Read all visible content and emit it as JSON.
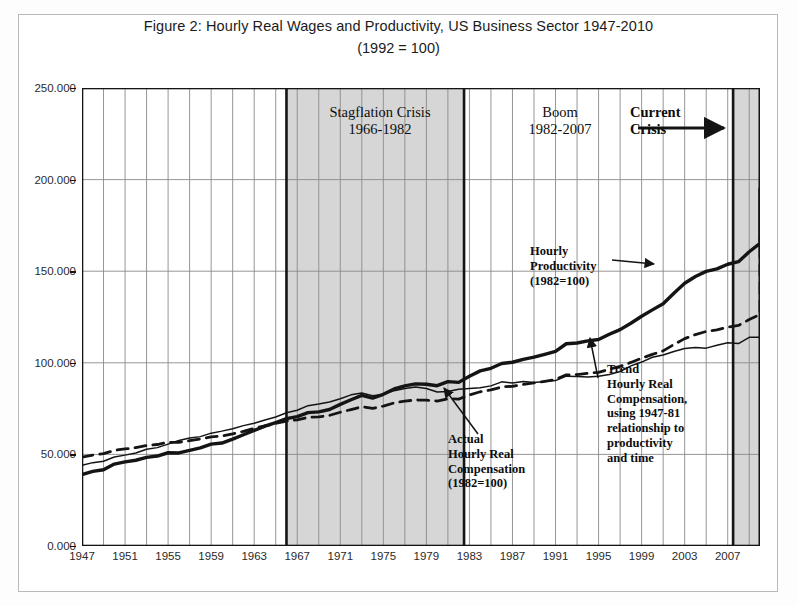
{
  "figure": {
    "title": "Figure 2: Hourly Real Wages and Productivity, US Business Sector 1947-2010",
    "subtitle": "(1992 = 100)"
  },
  "axes": {
    "y_ticks": [
      "0.000",
      "50.000",
      "100.000",
      "150.000",
      "200.000",
      "250.000"
    ],
    "y_values": [
      0,
      50,
      100,
      150,
      200,
      250
    ],
    "x_ticks": [
      "1947",
      "1951",
      "1955",
      "1959",
      "1963",
      "1967",
      "1971",
      "1975",
      "1979",
      "1983",
      "1987",
      "1991",
      "1995",
      "1999",
      "2003",
      "2007"
    ],
    "x_values": [
      1947,
      1951,
      1955,
      1959,
      1963,
      1967,
      1971,
      1975,
      1979,
      1983,
      1987,
      1991,
      1995,
      1999,
      2003,
      2007
    ]
  },
  "annotations": {
    "stagflation": "Stagflation Crisis\n1966-1982",
    "boom": "Boom\n1982-2007",
    "current_crisis": "Current\nCrisis",
    "productivity": "Hourly\nProductivity\n(1982=100)",
    "actual": "Actual\nHourly Real\nCompensation\n(1982=100)",
    "trend": "Trend\nHourly Real\nCompensation,\nusing 1947-81\nrelationship to\nproductivity\nand time"
  },
  "colors": {
    "line": "#141414",
    "grid": "#8a8a8a",
    "band_fill": "#cfcfcf",
    "frame": "#b9b9b9",
    "plot_border": "#141414",
    "background": "#ffffff"
  },
  "bands": [
    {
      "name": "stagflation-band",
      "start": 1966,
      "end": 1982.5
    },
    {
      "name": "current-crisis-band",
      "start": 2007.5,
      "end": 2010
    }
  ],
  "chart_data": {
    "type": "line",
    "title": "Figure 2: Hourly Real Wages and Productivity, US Business Sector 1947-2010",
    "subtitle": "(1992 = 100)",
    "xlabel": "",
    "ylabel": "",
    "xlim": [
      1947,
      2010
    ],
    "ylim": [
      0,
      250
    ],
    "grid": true,
    "legend": "annotated-inline",
    "x": [
      1947,
      1948,
      1949,
      1950,
      1951,
      1952,
      1953,
      1954,
      1955,
      1956,
      1957,
      1958,
      1959,
      1960,
      1961,
      1962,
      1963,
      1964,
      1965,
      1966,
      1967,
      1968,
      1969,
      1970,
      1971,
      1972,
      1973,
      1974,
      1975,
      1976,
      1977,
      1978,
      1979,
      1980,
      1981,
      1982,
      1983,
      1984,
      1985,
      1986,
      1987,
      1988,
      1989,
      1990,
      1991,
      1992,
      1993,
      1994,
      1995,
      1996,
      1997,
      1998,
      1999,
      2000,
      2001,
      2002,
      2003,
      2004,
      2005,
      2006,
      2007,
      2008,
      2009,
      2010
    ],
    "series": [
      {
        "name": "Hourly Productivity (1982=100)",
        "style": "thick-solid",
        "values": [
          39.0,
          40.7,
          41.6,
          44.7,
          45.9,
          46.8,
          48.4,
          49.1,
          50.9,
          50.8,
          52.2,
          53.6,
          55.6,
          56.2,
          58.3,
          60.7,
          63.1,
          65.4,
          67.4,
          69.5,
          70.6,
          72.8,
          73.2,
          74.5,
          77.3,
          79.8,
          82.2,
          80.7,
          82.8,
          85.7,
          87.4,
          88.5,
          88.3,
          87.5,
          89.7,
          89.3,
          92.7,
          95.6,
          97.0,
          99.6,
          100.3,
          101.9,
          103.1,
          104.6,
          106.2,
          110.4,
          110.8,
          112.0,
          112.7,
          115.6,
          118.1,
          121.6,
          125.4,
          128.9,
          132.2,
          138.0,
          143.4,
          147.1,
          149.9,
          151.3,
          153.8,
          155.2,
          160.6,
          165.2
        ],
        "end_value": 195
      },
      {
        "name": "Trend Hourly Real Compensation (1947-81 relationship)",
        "style": "dashed",
        "values": [
          48.5,
          49.6,
          50.4,
          52.2,
          53.0,
          53.7,
          54.8,
          55.4,
          56.6,
          56.6,
          57.5,
          58.4,
          59.6,
          60.0,
          61.2,
          62.6,
          64.2,
          65.6,
          66.9,
          68.2,
          68.9,
          70.2,
          70.5,
          71.3,
          73.0,
          74.5,
          76.0,
          75.1,
          76.4,
          78.1,
          79.1,
          79.7,
          79.6,
          79.1,
          80.4,
          80.2,
          82.4,
          84.2,
          85.2,
          86.8,
          87.2,
          88.2,
          89.0,
          89.9,
          90.9,
          93.4,
          93.6,
          94.3,
          94.8,
          96.5,
          98.1,
          100.2,
          102.5,
          104.6,
          106.5,
          110.0,
          113.2,
          115.4,
          117.1,
          118.0,
          119.5,
          120.4,
          123.6,
          126.4
        ],
        "end_value": 168
      },
      {
        "name": "Actual Hourly Real Compensation (1982=100)",
        "style": "thin-solid",
        "values": [
          44.0,
          45.5,
          46.3,
          48.6,
          49.6,
          50.8,
          52.8,
          53.7,
          55.6,
          57.6,
          58.9,
          59.7,
          61.6,
          62.7,
          64.0,
          65.7,
          67.0,
          68.8,
          70.4,
          72.7,
          74.1,
          76.6,
          77.5,
          78.6,
          80.4,
          82.5,
          83.5,
          82.0,
          82.7,
          84.8,
          86.0,
          86.8,
          86.0,
          84.1,
          84.3,
          85.6,
          86.0,
          86.4,
          87.4,
          89.6,
          89.0,
          89.8,
          89.3,
          89.8,
          90.3,
          92.7,
          92.5,
          92.3,
          92.6,
          93.6,
          95.2,
          98.3,
          100.4,
          103.0,
          104.3,
          106.2,
          107.8,
          108.3,
          108.0,
          109.6,
          111.0,
          110.5,
          113.9,
          114.0
        ],
        "end_value": 138
      }
    ]
  }
}
